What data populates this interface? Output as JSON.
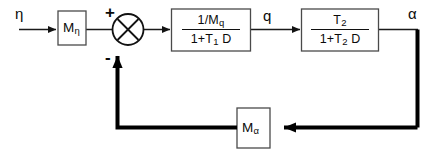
{
  "diagram": {
    "type": "control-system-block-diagram",
    "signals": {
      "input": "η",
      "intermediate": "q",
      "output": "α"
    },
    "summing_junction": {
      "name": "summing-junction",
      "style": "circle-with-cross",
      "plus_sign": "+",
      "minus_sign": "-",
      "plus_input": "forward from Mη",
      "minus_input": "feedback from Mα"
    },
    "blocks": [
      {
        "id": "m-eta",
        "label": "M",
        "subscript": "η",
        "kind": "gain"
      },
      {
        "id": "tf-1",
        "numerator": "1/M",
        "numerator_sub": "q",
        "denominator_a": "1+T",
        "denominator_sub": "1",
        "denominator_b": " D",
        "kind": "transfer-function"
      },
      {
        "id": "tf-2",
        "numerator": "T",
        "numerator_sub": "2",
        "denominator_a": "1+T",
        "denominator_sub": "2",
        "denominator_b": " D",
        "kind": "transfer-function"
      },
      {
        "id": "m-alpha",
        "label": "M",
        "subscript": "α",
        "kind": "feedback-gain"
      }
    ],
    "colors": {
      "background": "#ffffff",
      "line": "#1a1a1a",
      "feedback_line": "#000000",
      "block_stroke": "#3a3a3a",
      "block_fill": "#ffffff",
      "text": "#0a0a0a"
    }
  }
}
